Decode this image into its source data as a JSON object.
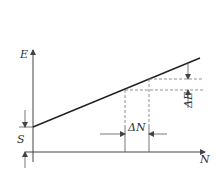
{
  "diagram": {
    "type": "linear relationship plot",
    "axes": {
      "y_label": "E",
      "x_label": "N"
    },
    "annotations": {
      "intercept_label": "S",
      "delta_y_label": "ΔE",
      "delta_x_label": "ΔN"
    },
    "colors": {
      "line": "#222222",
      "axis": "#444444",
      "dashed": "#777777"
    }
  }
}
